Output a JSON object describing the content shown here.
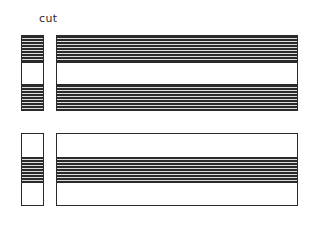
{
  "figure": {
    "title_label": "cut",
    "background_color": "#ffffff",
    "ink_color": "#2a2a2a",
    "fill_hatched_color": "#2a2a2a",
    "fill_plain_color": "#ffffff"
  },
  "groups": [
    {
      "name": "upper-group",
      "cross_section": {
        "name": "upper-cross-section",
        "bands": [
          {
            "fill": "hatched",
            "label": "upper-cross-band-1"
          },
          {
            "fill": "plain",
            "label": "upper-cross-band-2"
          },
          {
            "fill": "hatched",
            "label": "upper-cross-band-3"
          }
        ]
      },
      "elevation": {
        "name": "upper-elevation",
        "bands": [
          {
            "fill": "hatched",
            "label": "upper-elevation-band-1"
          },
          {
            "fill": "plain",
            "label": "upper-elevation-band-2"
          },
          {
            "fill": "hatched",
            "label": "upper-elevation-band-3"
          }
        ]
      }
    },
    {
      "name": "lower-group",
      "cross_section": {
        "name": "lower-cross-section",
        "bands": [
          {
            "fill": "plain",
            "label": "lower-cross-band-1"
          },
          {
            "fill": "hatched",
            "label": "lower-cross-band-2"
          },
          {
            "fill": "plain",
            "label": "lower-cross-band-3"
          }
        ]
      },
      "elevation": {
        "name": "lower-elevation",
        "bands": [
          {
            "fill": "plain",
            "label": "lower-elevation-band-1"
          },
          {
            "fill": "hatched",
            "label": "lower-elevation-band-2"
          },
          {
            "fill": "plain",
            "label": "lower-elevation-band-3"
          }
        ]
      }
    }
  ]
}
